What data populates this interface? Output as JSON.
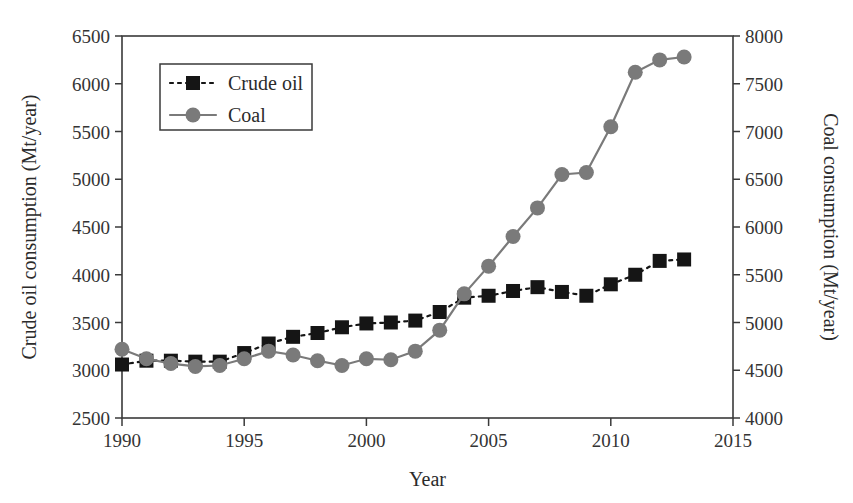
{
  "chart_data": {
    "type": "line",
    "title": "",
    "xlabel": "Year",
    "ylabel": "Crude oil consumption (Mt/year)",
    "y2label": "Coal consumption (Mt/year)",
    "x": [
      1990,
      1991,
      1992,
      1993,
      1994,
      1995,
      1996,
      1997,
      1998,
      1999,
      2000,
      2001,
      2002,
      2003,
      2004,
      2005,
      2006,
      2007,
      2008,
      2009,
      2010,
      2011,
      2012,
      2013
    ],
    "xlim": [
      1990,
      2015
    ],
    "xticks": [
      1990,
      1995,
      2000,
      2005,
      2010,
      2015
    ],
    "ylim": [
      2500,
      6500
    ],
    "yticks": [
      2500,
      3000,
      3500,
      4000,
      4500,
      5000,
      5500,
      6000,
      6500
    ],
    "y2lim": [
      4000,
      8000
    ],
    "y2ticks": [
      4000,
      4500,
      5000,
      5500,
      6000,
      6500,
      7000,
      7500,
      8000
    ],
    "grid": false,
    "legend_position": "upper left",
    "series": [
      {
        "name": "Crude oil",
        "axis": "left",
        "marker": "square",
        "linestyle": "dashed",
        "color": "#151515",
        "values": [
          3060,
          3100,
          3100,
          3090,
          3090,
          3180,
          3280,
          3350,
          3390,
          3450,
          3490,
          3500,
          3520,
          3610,
          3760,
          3780,
          3830,
          3870,
          3820,
          3780,
          3900,
          4000,
          4145,
          4160
        ]
      },
      {
        "name": "Coal",
        "axis": "right",
        "marker": "circle",
        "linestyle": "solid",
        "color": "#7a7a7a",
        "values": [
          4720,
          4620,
          4570,
          4540,
          4550,
          4620,
          4700,
          4660,
          4600,
          4550,
          4620,
          4610,
          4700,
          4920,
          5300,
          5590,
          5900,
          6200,
          6550,
          6570,
          7050,
          7620,
          7750,
          7780
        ]
      }
    ]
  },
  "axes": {
    "left": {
      "title": "Crude oil consumption (Mt/year)",
      "tick_labels": [
        "2500",
        "3000",
        "3500",
        "4000",
        "4500",
        "5000",
        "5500",
        "6000",
        "6500"
      ]
    },
    "right": {
      "title": "Coal consumption (Mt/year)",
      "tick_labels": [
        "4000",
        "4500",
        "5000",
        "5500",
        "6000",
        "6500",
        "7000",
        "7500",
        "8000"
      ]
    },
    "bottom": {
      "title": "Year",
      "tick_labels": [
        "1990",
        "1995",
        "2000",
        "2005",
        "2010",
        "2015"
      ]
    }
  },
  "legend": {
    "entries": [
      {
        "label": "Crude oil",
        "color": "#151515",
        "marker": "square",
        "linestyle": "dashed"
      },
      {
        "label": "Coal",
        "color": "#7a7a7a",
        "marker": "circle",
        "linestyle": "solid"
      }
    ]
  },
  "colors": {
    "crude_oil": "#151515",
    "coal": "#7a7a7a",
    "axis": "#3a3a3a",
    "text": "#2b2b2b",
    "background": "#ffffff"
  }
}
